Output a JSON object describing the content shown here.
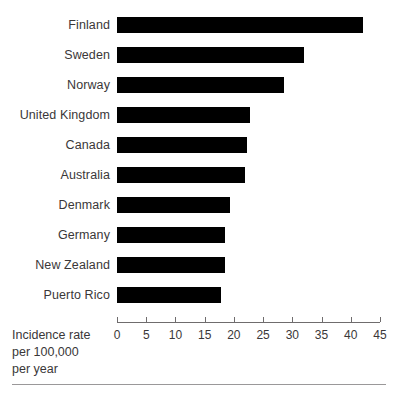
{
  "chart_data": {
    "type": "bar",
    "orientation": "horizontal",
    "title": "",
    "subtitle": "",
    "xlabel": "Incidence rate per 100,000 per year",
    "ylabel": "",
    "categories": [
      "Finland",
      "Sweden",
      "Norway",
      "United Kingdom",
      "Canada",
      "Australia",
      "Denmark",
      "Germany",
      "New Zealand",
      "Puerto Rico"
    ],
    "values": [
      42.1,
      32.0,
      28.6,
      22.8,
      22.3,
      21.9,
      19.3,
      18.5,
      18.5,
      17.8
    ],
    "series": [
      {
        "name": "Incidence rate per 100,000 per year",
        "values": [
          42.1,
          32.0,
          28.6,
          22.8,
          22.3,
          21.9,
          19.3,
          18.5,
          18.5,
          17.8
        ]
      }
    ],
    "xlim": [
      0,
      45
    ],
    "xticks": [
      0,
      5,
      10,
      15,
      20,
      25,
      30,
      35,
      40,
      45
    ],
    "xtick_labels": [
      "0",
      "5",
      "10",
      "15",
      "20",
      "25",
      "30",
      "35",
      "40",
      "45"
    ],
    "grid": false,
    "legend": false,
    "legend_position": "none",
    "bar_color": "#000000",
    "axis_color": "#6f6c6d",
    "text_color": "#3a3738"
  },
  "axis_caption": {
    "line1": "Incidence rate",
    "line2": "per 100,000",
    "line3": "per year"
  }
}
